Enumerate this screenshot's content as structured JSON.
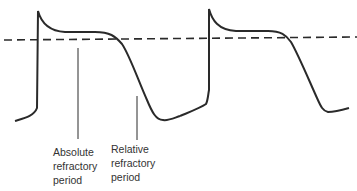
{
  "diagram": {
    "threshold_line": "dashed",
    "labels": {
      "absolute": {
        "line1": "Absolute",
        "line2": "refractory",
        "line3": "period"
      },
      "relative": {
        "line1": "Relative",
        "line2": "refractory",
        "line3": "period"
      }
    },
    "colors": {
      "stroke": "#2a2a2a",
      "text": "#333333",
      "background": "#ffffff"
    }
  }
}
